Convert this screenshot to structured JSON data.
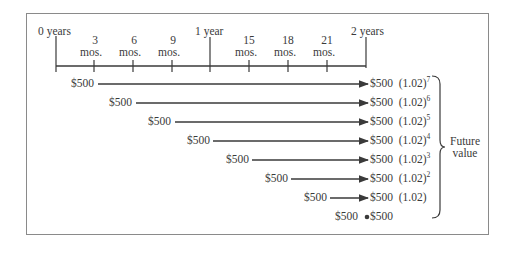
{
  "timeline": {
    "ticks": [
      {
        "label": "0 years",
        "sub": ""
      },
      {
        "label": "3",
        "sub": "mos."
      },
      {
        "label": "6",
        "sub": "mos."
      },
      {
        "label": "9",
        "sub": "mos."
      },
      {
        "label": "1 year",
        "sub": ""
      },
      {
        "label": "15",
        "sub": "mos."
      },
      {
        "label": "18",
        "sub": "mos."
      },
      {
        "label": "21",
        "sub": "mos."
      },
      {
        "label": "2 years",
        "sub": ""
      }
    ]
  },
  "rows": [
    {
      "deposit": "$500",
      "value": "$500",
      "factor": "(1.02)",
      "exp": "7"
    },
    {
      "deposit": "$500",
      "value": "$500",
      "factor": "(1.02)",
      "exp": "6"
    },
    {
      "deposit": "$500",
      "value": "$500",
      "factor": "(1.02)",
      "exp": "5"
    },
    {
      "deposit": "$500",
      "value": "$500",
      "factor": "(1.02)",
      "exp": "4"
    },
    {
      "deposit": "$500",
      "value": "$500",
      "factor": "(1.02)",
      "exp": "3"
    },
    {
      "deposit": "$500",
      "value": "$500",
      "factor": "(1.02)",
      "exp": "2"
    },
    {
      "deposit": "$500",
      "value": "$500",
      "factor": "(1.02)",
      "exp": ""
    },
    {
      "deposit": "$500",
      "value": "$500",
      "factor": "",
      "exp": ""
    }
  ],
  "brace_label": {
    "line1": "Future",
    "line2": "value"
  },
  "colors": {
    "ink": "#3a3a3a",
    "frame": "#8a8a8a"
  }
}
